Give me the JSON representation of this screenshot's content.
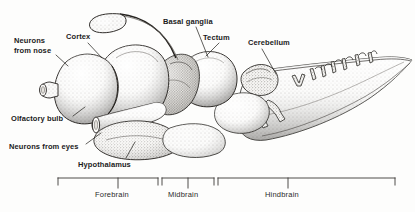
{
  "figure": {
    "type": "anatomical-illustration",
    "style": "stippled pen-and-ink line drawing, grayscale",
    "width": 415,
    "height": 212,
    "background_color": "#fdfdfc",
    "ink_color": "#1b1b1b"
  },
  "labels": {
    "neurons_from_nose": "Neurons\nfrom nose",
    "cortex": "Cortex",
    "basal_ganglia": "Basal ganglia",
    "tectum": "Tectum",
    "cerebellum": "Cerebellum",
    "olfactory_bulb": "Olfactory bulb",
    "neurons_from_eyes": "Neurons from eyes",
    "hypothalamus": "Hypothalamus"
  },
  "regions": {
    "forebrain": "Forebrain",
    "midbrain": "Midbrain",
    "hindbrain": "Hindbrain"
  },
  "brackets": [
    {
      "name": "forebrain",
      "x_start": 58,
      "x_end": 158,
      "rail_y": 178,
      "tick_height": 7,
      "stem_x": 118
    },
    {
      "name": "midbrain",
      "x_start": 162,
      "x_end": 214,
      "rail_y": 178,
      "tick_height": 7,
      "stem_x": 188
    },
    {
      "name": "hindbrain",
      "x_start": 218,
      "x_end": 395,
      "rail_y": 178,
      "tick_height": 7,
      "stem_x": 288
    }
  ],
  "leaders": [
    {
      "name": "neurons-from-nose-leader",
      "points": "56,55 68,66"
    },
    {
      "name": "cortex-leader",
      "points": "88,43 100,56"
    },
    {
      "name": "basal-ganglia-leader",
      "points": "196,27 208,57"
    },
    {
      "name": "tectum-leader",
      "points": "218,43 206,55"
    },
    {
      "name": "cerebellum-leader",
      "points": "262,49 276,74"
    },
    {
      "name": "olfactory-bulb-leader",
      "points": "73,117 84,108"
    },
    {
      "name": "neurons-from-eyes-leader",
      "points": "85,144 100,134"
    },
    {
      "name": "hypothalamus-leader",
      "points": "125,159 134,143"
    }
  ]
}
